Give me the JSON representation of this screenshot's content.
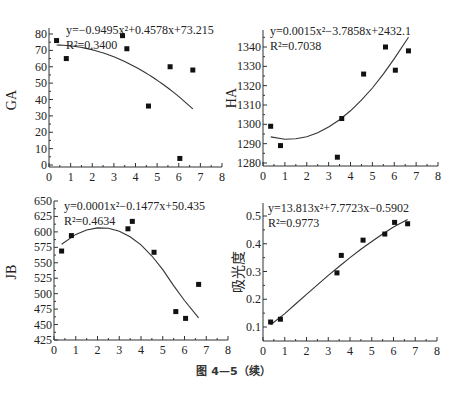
{
  "caption": "图 4—5（续）",
  "chart_data": [
    {
      "type": "scatter",
      "id": "ga",
      "ylabel": "GA",
      "xlabel": "",
      "xlim": [
        0,
        8
      ],
      "ylim": [
        0,
        80
      ],
      "xticks": [
        0,
        1,
        2,
        3,
        4,
        5,
        6,
        7,
        8
      ],
      "yticks": [
        0,
        10,
        20,
        30,
        40,
        50,
        60,
        70,
        80
      ],
      "equation": "y=−0.9495x²+0.4578x+73.215",
      "r2": "R²=0.3400",
      "points": [
        [
          0.35,
          76
        ],
        [
          0.8,
          65
        ],
        [
          3.4,
          79
        ],
        [
          3.6,
          71
        ],
        [
          4.6,
          36
        ],
        [
          5.6,
          60
        ],
        [
          6.05,
          4
        ],
        [
          6.65,
          58
        ]
      ],
      "fit": {
        "coef": [
          -0.9495,
          0.4578,
          73.215
        ],
        "x_range": [
          0.35,
          6.65
        ]
      }
    },
    {
      "type": "scatter",
      "id": "ha",
      "ylabel": "HA",
      "xlabel": "",
      "xlim": [
        0,
        8
      ],
      "ylim": [
        1278,
        1348
      ],
      "xticks": [
        0,
        1,
        2,
        3,
        4,
        5,
        6,
        7,
        8
      ],
      "yticks": [
        1280,
        1290,
        1300,
        1310,
        1320,
        1330,
        1340
      ],
      "equation": "y=0.0015x²−3.7858x+2432.1",
      "r2": "R²=0.7038",
      "points": [
        [
          0.35,
          1299
        ],
        [
          0.8,
          1289
        ],
        [
          3.4,
          1283
        ],
        [
          3.6,
          1303
        ],
        [
          4.6,
          1326
        ],
        [
          5.6,
          1340
        ],
        [
          6.05,
          1328
        ],
        [
          6.65,
          1338
        ]
      ],
      "fit": {
        "points": [
          [
            0.35,
            1293.5
          ],
          [
            1.0,
            1292.3
          ],
          [
            1.5,
            1292.5
          ],
          [
            2.0,
            1293.6
          ],
          [
            2.5,
            1295.6
          ],
          [
            3.0,
            1298.6
          ],
          [
            3.5,
            1302.4
          ],
          [
            4.0,
            1307.0
          ],
          [
            4.5,
            1312.5
          ],
          [
            5.0,
            1318.8
          ],
          [
            5.5,
            1326.0
          ],
          [
            6.0,
            1334.0
          ],
          [
            6.65,
            1345.0
          ]
        ]
      }
    },
    {
      "type": "scatter",
      "id": "jb",
      "ylabel": "JB",
      "xlabel": "",
      "xlim": [
        0,
        8
      ],
      "ylim": [
        425,
        650
      ],
      "xticks": [
        0,
        1,
        2,
        3,
        4,
        5,
        6,
        7,
        8
      ],
      "yticks": [
        425,
        450,
        475,
        500,
        525,
        550,
        575,
        600,
        625,
        650
      ],
      "equation": "y=0.0001x²−0.1477x+50.435",
      "r2": "R²=0.4634",
      "points": [
        [
          0.35,
          569
        ],
        [
          0.8,
          594
        ],
        [
          3.4,
          605
        ],
        [
          3.6,
          617
        ],
        [
          4.6,
          567
        ],
        [
          5.6,
          471
        ],
        [
          6.05,
          460
        ],
        [
          6.65,
          515
        ]
      ],
      "fit": {
        "points": [
          [
            0.35,
            580
          ],
          [
            1.0,
            596
          ],
          [
            1.5,
            603
          ],
          [
            2.0,
            606.5
          ],
          [
            2.5,
            606
          ],
          [
            3.0,
            601
          ],
          [
            3.5,
            592
          ],
          [
            4.0,
            579
          ],
          [
            4.5,
            561
          ],
          [
            5.0,
            539
          ],
          [
            5.5,
            513
          ],
          [
            6.0,
            489
          ],
          [
            6.65,
            461
          ]
        ]
      }
    },
    {
      "type": "scatter",
      "id": "absorbance",
      "ylabel": "吸光度",
      "xlabel": "",
      "xlim": [
        0,
        8
      ],
      "ylim": [
        0.05,
        0.55
      ],
      "xticks": [
        0,
        1,
        2,
        3,
        4,
        5,
        6,
        7,
        8
      ],
      "yticks": [
        0.1,
        0.2,
        0.3,
        0.4,
        0.5
      ],
      "equation": "y=13.813x²+7.7723x−0.5902",
      "r2": "R²=0.9773",
      "points": [
        [
          0.35,
          0.118
        ],
        [
          0.8,
          0.128
        ],
        [
          3.4,
          0.295
        ],
        [
          3.6,
          0.358
        ],
        [
          4.6,
          0.413
        ],
        [
          5.6,
          0.435
        ],
        [
          6.05,
          0.477
        ],
        [
          6.65,
          0.472
        ]
      ],
      "fit": {
        "points": [
          [
            0.35,
            0.108
          ],
          [
            1.0,
            0.148
          ],
          [
            1.5,
            0.183
          ],
          [
            2.0,
            0.218
          ],
          [
            2.5,
            0.252
          ],
          [
            3.0,
            0.286
          ],
          [
            3.5,
            0.318
          ],
          [
            4.0,
            0.35
          ],
          [
            4.5,
            0.38
          ],
          [
            5.0,
            0.408
          ],
          [
            5.5,
            0.435
          ],
          [
            6.0,
            0.46
          ],
          [
            6.65,
            0.487
          ]
        ]
      }
    }
  ]
}
